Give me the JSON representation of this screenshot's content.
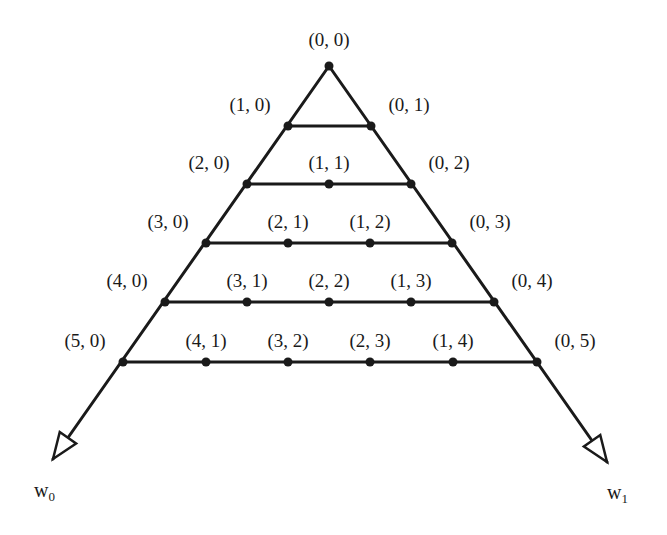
{
  "diagram": {
    "type": "triangular-lattice",
    "line_color": "#1a1a1a",
    "apex": {
      "label": "(0, 0)",
      "x": 329,
      "y": 66
    },
    "rows": [
      {
        "y": 66,
        "nodes": [
          {
            "label": "(0, 0)",
            "x": 329
          }
        ]
      },
      {
        "y": 126,
        "nodes": [
          {
            "label": "(1, 0)",
            "x": 288
          },
          {
            "label": "(0, 1)",
            "x": 371
          }
        ]
      },
      {
        "y": 184,
        "nodes": [
          {
            "label": "(2, 0)",
            "x": 247
          },
          {
            "label": "(1, 1)",
            "x": 329
          },
          {
            "label": "(0, 2)",
            "x": 411
          }
        ]
      },
      {
        "y": 243,
        "nodes": [
          {
            "label": "(3, 0)",
            "x": 206
          },
          {
            "label": "(2, 1)",
            "x": 288
          },
          {
            "label": "(1, 2)",
            "x": 370
          },
          {
            "label": "(0, 3)",
            "x": 452
          }
        ]
      },
      {
        "y": 302,
        "nodes": [
          {
            "label": "(4, 0)",
            "x": 165
          },
          {
            "label": "(3, 1)",
            "x": 247
          },
          {
            "label": "(2, 2)",
            "x": 329
          },
          {
            "label": "(1, 3)",
            "x": 411
          },
          {
            "label": "(0, 4)",
            "x": 494
          }
        ]
      },
      {
        "y": 362,
        "nodes": [
          {
            "label": "(5, 0)",
            "x": 123
          },
          {
            "label": "(4, 1)",
            "x": 206
          },
          {
            "label": "(3, 2)",
            "x": 288
          },
          {
            "label": "(2, 3)",
            "x": 370
          },
          {
            "label": "(1, 4)",
            "x": 453
          },
          {
            "label": "(0, 5)",
            "x": 537
          }
        ]
      }
    ],
    "axes": [
      {
        "name": "w",
        "subscript": "0",
        "tip": {
          "x": 53,
          "y": 459
        },
        "label_pos": {
          "x": 34,
          "y": 480
        }
      },
      {
        "name": "w",
        "subscript": "1",
        "tip": {
          "x": 607,
          "y": 462
        },
        "label_pos": {
          "x": 607,
          "y": 482
        }
      }
    ]
  }
}
